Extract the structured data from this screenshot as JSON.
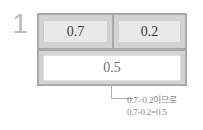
{
  "problem": {
    "number": "1"
  },
  "worksheet": {
    "table": {
      "top_row": {
        "cells": [
          {
            "label": "minuend-value",
            "value": "0.7"
          },
          {
            "label": "subtrahend-value",
            "value": "0.2"
          }
        ]
      },
      "bottom_row": {
        "cells": [
          {
            "label": "difference-value",
            "value": "0.5"
          }
        ]
      }
    },
    "annotation": {
      "lines": [
        "0.7>0.2이므로",
        "0.7-0.2=0.5"
      ]
    }
  },
  "colors": {
    "table_border": "#a8a8a8",
    "cell_fill": "#d3d3d3",
    "inner_fill": "#e9e9e9",
    "result_fill": "#ffffff",
    "value_text": "#3b3b3b",
    "annotation_text": "#8a8a8a",
    "problem_number": "#b9b9b9",
    "leader_line": "#b0b0b0"
  }
}
